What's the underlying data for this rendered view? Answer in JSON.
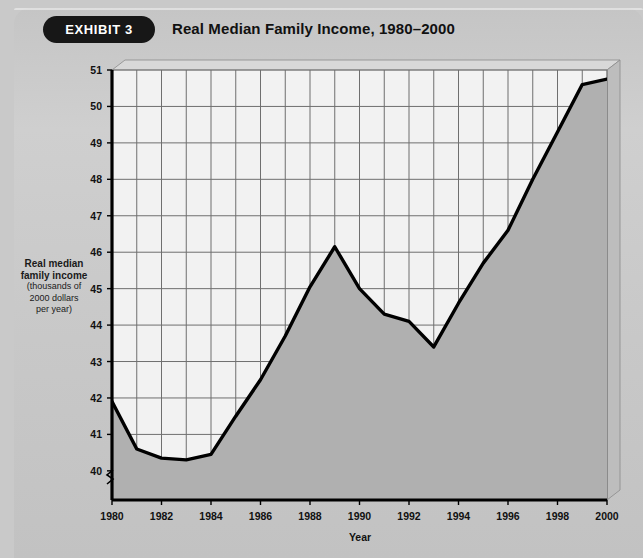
{
  "header": {
    "badge_label": "EXHIBIT 3",
    "title": "Real Median Family Income, 1980–2000"
  },
  "colors": {
    "page_background": "#c9c9c9",
    "panel_background": "#cbcbcb",
    "plot_background": "#f2f2f2",
    "area_fill": "#b0b0b0",
    "line": "#000000",
    "grid": "#6f6f6f",
    "axis": "#000000",
    "badge_background": "#171717",
    "badge_text": "#ffffff"
  },
  "chart_data": {
    "type": "area",
    "title": "Real Median Family Income, 1980–2000",
    "subtitle": "",
    "xlabel": "Year",
    "ylabel": "Real median family income (thousands of 2000 dollars per year)",
    "ylabel_lines": [
      "Real median",
      "family income",
      "(thousands of",
      "2000 dollars",
      "per year)"
    ],
    "xlim": [
      1980,
      2000
    ],
    "ylim": [
      39.2,
      51
    ],
    "y_ticks": [
      40,
      41,
      42,
      43,
      44,
      45,
      46,
      47,
      48,
      49,
      50,
      51
    ],
    "y_tick_labels": [
      "40",
      "41",
      "42",
      "43",
      "44",
      "45",
      "46",
      "47",
      "48",
      "49",
      "50",
      "51"
    ],
    "x_ticks": [
      1980,
      1982,
      1984,
      1986,
      1988,
      1990,
      1992,
      1994,
      1996,
      1998,
      2000
    ],
    "x_tick_labels": [
      "1980",
      "1982",
      "1984",
      "1986",
      "1988",
      "1990",
      "1992",
      "1994",
      "1996",
      "1998",
      "2000"
    ],
    "x_gridlines": [
      1980,
      1981,
      1982,
      1983,
      1984,
      1985,
      1986,
      1987,
      1988,
      1989,
      1990,
      1991,
      1992,
      1993,
      1994,
      1995,
      1996,
      1997,
      1998,
      1999,
      2000
    ],
    "grid": true,
    "legend": null,
    "axis_break": true,
    "x": [
      1980,
      1981,
      1982,
      1983,
      1984,
      1985,
      1986,
      1987,
      1988,
      1989,
      1990,
      1991,
      1992,
      1993,
      1994,
      1995,
      1996,
      1997,
      1998,
      1999,
      2000
    ],
    "values": [
      41.9,
      40.6,
      40.35,
      40.3,
      40.45,
      41.5,
      42.5,
      43.7,
      45.05,
      46.15,
      45.0,
      44.3,
      44.1,
      43.4,
      44.6,
      45.7,
      46.6,
      48.0,
      49.3,
      50.6,
      50.75
    ],
    "series": [
      {
        "name": "Real median family income",
        "values": [
          41.9,
          40.6,
          40.35,
          40.3,
          40.45,
          41.5,
          42.5,
          43.7,
          45.05,
          46.15,
          45.0,
          44.3,
          44.1,
          43.4,
          44.6,
          45.7,
          46.6,
          48.0,
          49.3,
          50.6,
          50.75
        ]
      }
    ]
  }
}
